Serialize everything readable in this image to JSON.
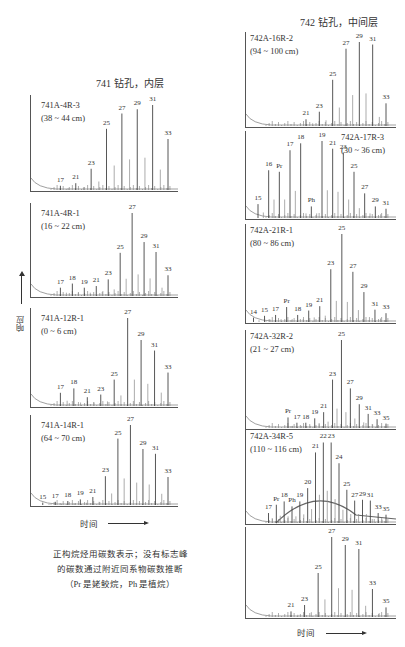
{
  "titles": {
    "left": "741 钻孔，内层",
    "right": "742 钻孔，中间层"
  },
  "axes": {
    "y_label": "响应",
    "x_label": "时间"
  },
  "caption": {
    "line1": "正构烷烃用碳数表示；没有标志峰",
    "line2": "的碳数通过附近同系物碳数推断",
    "line3": "（Pr 是姥鲛烷，Ph 是植烷）"
  },
  "chart_data": {
    "type": "bar",
    "xlabel": "时间",
    "ylabel": "响应",
    "grid": false,
    "legend": "none",
    "panels": [
      {
        "group": "741",
        "sample": "741A-4R-3",
        "depth": "(38 ~ 44 cm)",
        "peaks": [
          {
            "label": "17",
            "h": 0.05
          },
          {
            "label": "21",
            "h": 0.08
          },
          {
            "label": "23",
            "h": 0.25
          },
          {
            "label": "25",
            "h": 0.72
          },
          {
            "label": "27",
            "h": 0.9
          },
          {
            "label": "29",
            "h": 0.95
          },
          {
            "label": "31",
            "h": 1.0
          },
          {
            "label": "33",
            "h": 0.6
          }
        ]
      },
      {
        "group": "741",
        "sample": "741A-4R-1",
        "depth": "(16 ~ 22 cm)",
        "peaks": [
          {
            "label": "17",
            "h": 0.1
          },
          {
            "label": "18",
            "h": 0.15
          },
          {
            "label": "19",
            "h": 0.1
          },
          {
            "label": "21",
            "h": 0.12
          },
          {
            "label": "23",
            "h": 0.2
          },
          {
            "label": "25",
            "h": 0.52
          },
          {
            "label": "27",
            "h": 1.0
          },
          {
            "label": "29",
            "h": 0.65
          },
          {
            "label": "31",
            "h": 0.53
          },
          {
            "label": "33",
            "h": 0.25
          }
        ]
      },
      {
        "group": "741",
        "sample": "741A-12R-1",
        "depth": "(0 ~ 6 cm)",
        "peaks": [
          {
            "label": "17",
            "h": 0.15
          },
          {
            "label": "18",
            "h": 0.2
          },
          {
            "label": "21",
            "h": 0.1
          },
          {
            "label": "23",
            "h": 0.13
          },
          {
            "label": "25",
            "h": 0.3
          },
          {
            "label": "27",
            "h": 1.0
          },
          {
            "label": "29",
            "h": 0.75
          },
          {
            "label": "31",
            "h": 0.63
          },
          {
            "label": "33",
            "h": 0.38
          }
        ]
      },
      {
        "group": "741",
        "sample": "741A-14R-1",
        "depth": "(64 ~ 70 cm)",
        "peaks": [
          {
            "label": "15",
            "h": 0.03
          },
          {
            "label": "17",
            "h": 0.04
          },
          {
            "label": "18",
            "h": 0.05
          },
          {
            "label": "19",
            "h": 0.07
          },
          {
            "label": "21",
            "h": 0.1
          },
          {
            "label": "23",
            "h": 0.36
          },
          {
            "label": "25",
            "h": 0.83
          },
          {
            "label": "27",
            "h": 1.0
          },
          {
            "label": "29",
            "h": 0.7
          },
          {
            "label": "31",
            "h": 0.64
          },
          {
            "label": "33",
            "h": 0.35
          }
        ]
      },
      {
        "group": "742",
        "sample": "742A-16R-2",
        "depth": "(94 ~ 100 cm)",
        "peaks": [
          {
            "label": "21",
            "h": 0.08
          },
          {
            "label": "23",
            "h": 0.17
          },
          {
            "label": "25",
            "h": 0.55
          },
          {
            "label": "27",
            "h": 0.92
          },
          {
            "label": "29",
            "h": 1.0
          },
          {
            "label": "31",
            "h": 0.97
          },
          {
            "label": "33",
            "h": 0.27
          }
        ]
      },
      {
        "group": "742",
        "sample": "742A-17R-3",
        "depth": "(30 ~ 36 cm)",
        "peaks": [
          {
            "label": "15",
            "h": 0.18
          },
          {
            "label": "16",
            "h": 0.62
          },
          {
            "label": "Pr",
            "h": 0.6
          },
          {
            "label": "17",
            "h": 0.88
          },
          {
            "label": "18",
            "h": 0.97
          },
          {
            "label": "Ph",
            "h": 0.15
          },
          {
            "label": "19",
            "h": 1.0
          },
          {
            "label": "21",
            "h": 0.9
          },
          {
            "label": "23",
            "h": 0.85
          },
          {
            "label": "25",
            "h": 0.6
          },
          {
            "label": "27",
            "h": 0.32
          },
          {
            "label": "29",
            "h": 0.15
          },
          {
            "label": "31",
            "h": 0.12
          }
        ]
      },
      {
        "group": "742",
        "sample": "742A-21R-1",
        "depth": "(80 ~ 86 cm)",
        "peaks": [
          {
            "label": "14",
            "h": 0.05
          },
          {
            "label": "15",
            "h": 0.07
          },
          {
            "label": "17",
            "h": 0.08
          },
          {
            "label": "Pr",
            "h": 0.17
          },
          {
            "label": "18",
            "h": 0.08
          },
          {
            "label": "19",
            "h": 0.13
          },
          {
            "label": "21",
            "h": 0.18
          },
          {
            "label": "23",
            "h": 0.6
          },
          {
            "label": "25",
            "h": 1.0
          },
          {
            "label": "27",
            "h": 0.57
          },
          {
            "label": "29",
            "h": 0.34
          },
          {
            "label": "31",
            "h": 0.14
          },
          {
            "label": "33",
            "h": 0.1
          }
        ]
      },
      {
        "group": "742",
        "sample": "742A-32R-2",
        "depth": "(21 ~ 27 cm)",
        "peaks": [
          {
            "label": "Pr",
            "h": 0.12
          },
          {
            "label": "17",
            "h": 0.06
          },
          {
            "label": "18",
            "h": 0.06
          },
          {
            "label": "19",
            "h": 0.11
          },
          {
            "label": "21",
            "h": 0.18
          },
          {
            "label": "23",
            "h": 0.55
          },
          {
            "label": "25",
            "h": 1.0
          },
          {
            "label": "27",
            "h": 0.45
          },
          {
            "label": "29",
            "h": 0.27
          },
          {
            "label": "31",
            "h": 0.16
          },
          {
            "label": "33",
            "h": 0.1
          },
          {
            "label": "35",
            "h": 0.05
          }
        ]
      },
      {
        "group": "742",
        "sample": "742A-34R-5",
        "depth": "(110 ~ 116 cm)",
        "peaks": [
          {
            "label": "17",
            "h": 0.12
          },
          {
            "label": "Pr",
            "h": 0.22
          },
          {
            "label": "18",
            "h": 0.26
          },
          {
            "label": "Ph",
            "h": 0.2
          },
          {
            "label": "19",
            "h": 0.26
          },
          {
            "label": "20",
            "h": 0.42
          },
          {
            "label": "21",
            "h": 0.85
          },
          {
            "label": "22",
            "h": 0.97
          },
          {
            "label": "23",
            "h": 0.97
          },
          {
            "label": "24",
            "h": 0.72
          },
          {
            "label": "25",
            "h": 0.4
          },
          {
            "label": "27",
            "h": 0.27
          },
          {
            "label": "29",
            "h": 0.28
          },
          {
            "label": "31",
            "h": 0.27
          },
          {
            "label": "33",
            "h": 0.12
          },
          {
            "label": "35",
            "h": 0.1
          }
        ]
      },
      {
        "group": "742",
        "sample": "",
        "depth": "",
        "peaks": [
          {
            "label": "21",
            "h": 0.07
          },
          {
            "label": "23",
            "h": 0.15
          },
          {
            "label": "25",
            "h": 0.55
          },
          {
            "label": "27",
            "h": 1.0
          },
          {
            "label": "29",
            "h": 0.9
          },
          {
            "label": "31",
            "h": 0.85
          },
          {
            "label": "33",
            "h": 0.35
          },
          {
            "label": "35",
            "h": 0.12
          }
        ]
      }
    ]
  }
}
